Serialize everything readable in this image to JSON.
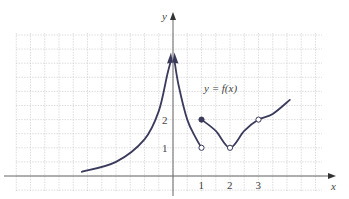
{
  "chart_data": {
    "type": "line",
    "title": "",
    "function_label": "y = f(x)",
    "xlabel": "x",
    "ylabel": "y",
    "x_ticks": [
      "1",
      "2",
      "3"
    ],
    "y_ticks": [
      "1",
      "2"
    ],
    "grid": true,
    "grid_step": 0.5,
    "xlim": [
      -5.5,
      5.2
    ],
    "ylim": [
      -0.5,
      5.8
    ],
    "colors": {
      "curve": "#3a3a5c",
      "axis": "#555555",
      "grid": "#c8c8c8"
    },
    "pieces": [
      {
        "name": "left-branch",
        "description": "increasing curve approaching vertical asymptote at x=0 from left, arrow pointing up",
        "points": [
          [
            -3.2,
            0.15
          ],
          [
            -2,
            0.5
          ],
          [
            -1,
            1.3
          ],
          [
            -0.5,
            2.3
          ],
          [
            -0.2,
            3.6
          ],
          [
            -0.07,
            4.1
          ]
        ],
        "end_arrow": "up"
      },
      {
        "name": "middle-branch",
        "description": "decreasing curve from vertical asymptote at x=0 down to open circle at (1,1)",
        "points": [
          [
            0.05,
            4.1
          ],
          [
            0.2,
            3.2
          ],
          [
            0.5,
            2.0
          ],
          [
            0.8,
            1.35
          ],
          [
            1,
            1
          ]
        ],
        "start_arrow": "up",
        "end_point": {
          "x": 1,
          "y": 1,
          "type": "open"
        }
      },
      {
        "name": "right-branch",
        "description": "starts at closed point (1,2), decreases to open point (2,1), rises through open point (3,2), continues up",
        "points": [
          [
            1,
            2
          ],
          [
            1.5,
            1.6
          ],
          [
            2,
            1
          ],
          [
            2.5,
            1.6
          ],
          [
            3,
            2
          ],
          [
            3.5,
            2.2
          ],
          [
            4.1,
            2.7
          ]
        ],
        "special_points": [
          {
            "x": 1,
            "y": 2,
            "type": "closed"
          },
          {
            "x": 2,
            "y": 1,
            "type": "open"
          },
          {
            "x": 3,
            "y": 2,
            "type": "open"
          }
        ]
      }
    ]
  }
}
